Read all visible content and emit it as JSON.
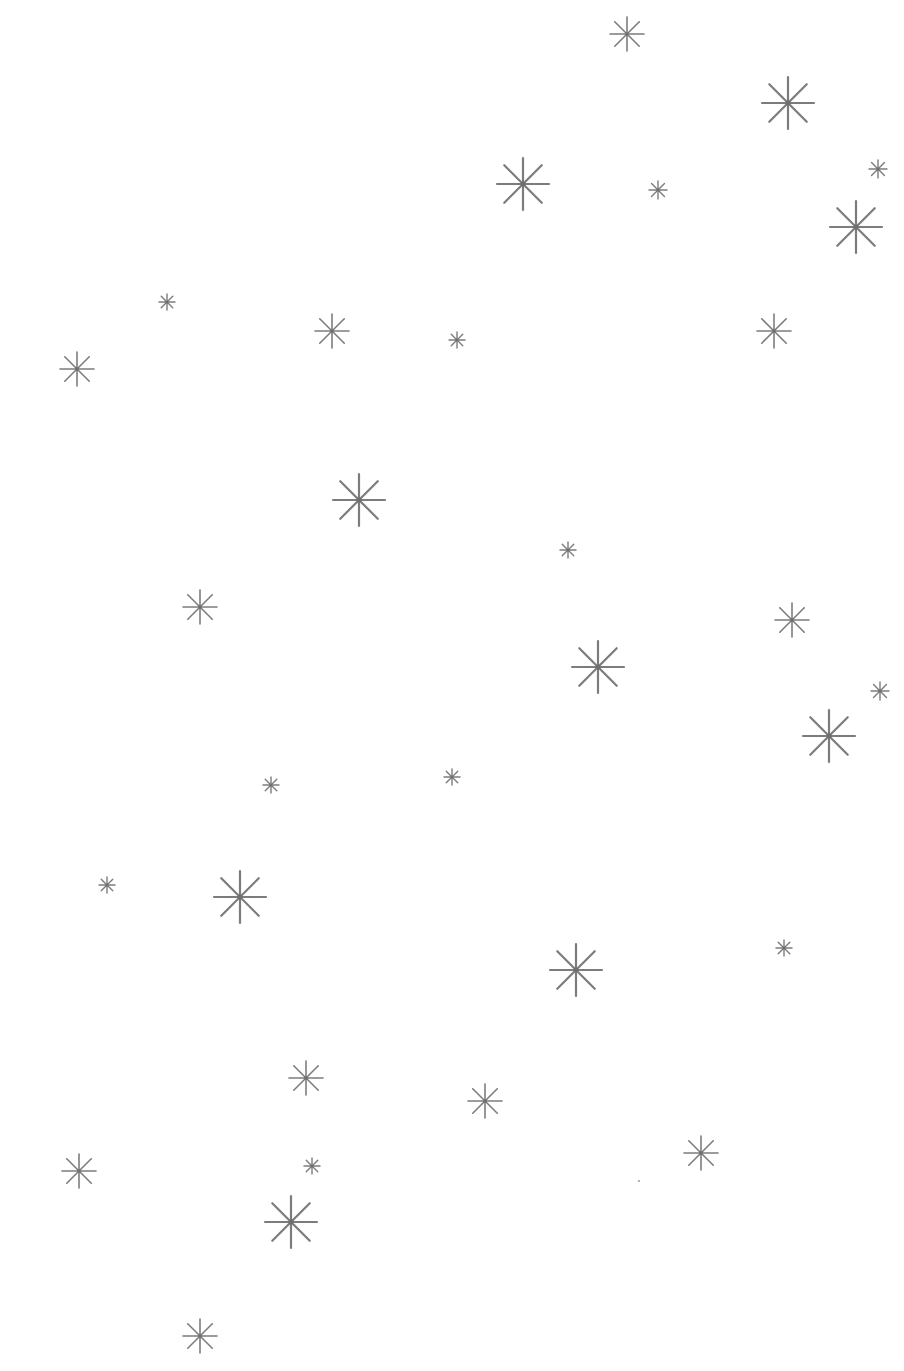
{
  "canvas": {
    "width": 904,
    "height": 1371,
    "background": "#ffffff"
  },
  "star_color": "#6e6e6e",
  "stars": [
    {
      "x": 627,
      "y": 34,
      "size": 34
    },
    {
      "x": 788,
      "y": 103,
      "size": 52
    },
    {
      "x": 523,
      "y": 184,
      "size": 52
    },
    {
      "x": 658,
      "y": 190,
      "size": 18
    },
    {
      "x": 878,
      "y": 169,
      "size": 18
    },
    {
      "x": 856,
      "y": 227,
      "size": 52
    },
    {
      "x": 167,
      "y": 302,
      "size": 16
    },
    {
      "x": 332,
      "y": 331,
      "size": 34
    },
    {
      "x": 457,
      "y": 340,
      "size": 16
    },
    {
      "x": 774,
      "y": 331,
      "size": 34
    },
    {
      "x": 77,
      "y": 369,
      "size": 34
    },
    {
      "x": 359,
      "y": 500,
      "size": 52
    },
    {
      "x": 568,
      "y": 550,
      "size": 16
    },
    {
      "x": 200,
      "y": 607,
      "size": 34
    },
    {
      "x": 792,
      "y": 620,
      "size": 34
    },
    {
      "x": 598,
      "y": 667,
      "size": 52
    },
    {
      "x": 880,
      "y": 691,
      "size": 18
    },
    {
      "x": 829,
      "y": 736,
      "size": 52
    },
    {
      "x": 271,
      "y": 785,
      "size": 16
    },
    {
      "x": 452,
      "y": 777,
      "size": 16
    },
    {
      "x": 107,
      "y": 885,
      "size": 16
    },
    {
      "x": 240,
      "y": 897,
      "size": 52
    },
    {
      "x": 784,
      "y": 948,
      "size": 16
    },
    {
      "x": 576,
      "y": 970,
      "size": 52
    },
    {
      "x": 306,
      "y": 1078,
      "size": 34
    },
    {
      "x": 485,
      "y": 1101,
      "size": 34
    },
    {
      "x": 701,
      "y": 1153,
      "size": 34
    },
    {
      "x": 79,
      "y": 1171,
      "size": 34
    },
    {
      "x": 312,
      "y": 1166,
      "size": 16
    },
    {
      "x": 291,
      "y": 1222,
      "size": 52
    },
    {
      "x": 200,
      "y": 1336,
      "size": 34
    }
  ],
  "dots": [
    {
      "x": 638,
      "y": 1180
    }
  ]
}
